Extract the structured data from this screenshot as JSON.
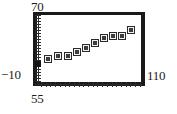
{
  "chart_data": {
    "type": "scatter",
    "title": "",
    "subtitle": "",
    "xlabel": "",
    "ylabel": "",
    "xlim": [
      55,
      110
    ],
    "ylim": [
      -10,
      70
    ],
    "grid": false,
    "legend": null,
    "x_tick_labels": [
      "55",
      "110"
    ],
    "y_tick_labels": [
      "-10",
      "70"
    ],
    "annotations": [],
    "series": [
      {
        "name": "data",
        "marker": "square",
        "x": [
          55,
          60,
          65,
          70,
          74,
          78,
          83,
          87,
          92,
          97,
          102
        ],
        "y": [
          2,
          8,
          10,
          10,
          14,
          18,
          24,
          30,
          33,
          33,
          40
        ],
        "points": [
          {
            "x": 55,
            "y": 2,
            "px": 38,
            "py": 64
          },
          {
            "x": 60,
            "y": 8,
            "px": 48,
            "py": 59
          },
          {
            "x": 65,
            "y": 10,
            "px": 58,
            "py": 56
          },
          {
            "x": 70,
            "y": 10,
            "px": 68,
            "py": 56
          },
          {
            "x": 74,
            "y": 14,
            "px": 77,
            "py": 52
          },
          {
            "x": 78,
            "y": 18,
            "px": 86,
            "py": 48
          },
          {
            "x": 83,
            "y": 24,
            "px": 95,
            "py": 43
          },
          {
            "x": 87,
            "y": 30,
            "px": 104,
            "py": 38
          },
          {
            "x": 92,
            "y": 33,
            "px": 113,
            "py": 36
          },
          {
            "x": 97,
            "y": 33,
            "px": 122,
            "py": 36
          },
          {
            "x": 102,
            "y": 40,
            "px": 131,
            "py": 30
          }
        ]
      }
    ]
  },
  "axes": {
    "y_max_label": "70",
    "y_min_label": "−10",
    "x_min_label": "55",
    "x_max_label": "110"
  },
  "colors": {
    "frame": "#1a1a1a",
    "axis": "#2b2b2b",
    "marker": "#3d3d3d",
    "background": "#ffffff",
    "text": "#1c1c1c"
  }
}
